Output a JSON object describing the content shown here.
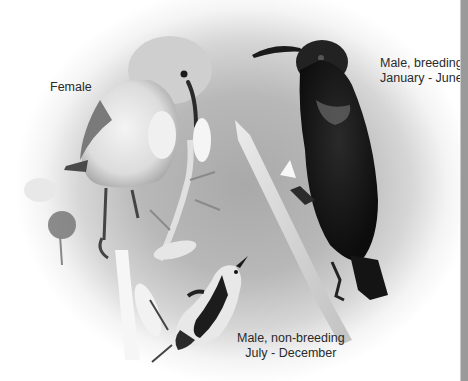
{
  "image": {
    "description": "Three sunbird plumage photos composited on a grey vignette background",
    "background_color": "#b0b0b0",
    "strip_color": "#9a9a9a"
  },
  "labels": {
    "female": {
      "line1": "Female"
    },
    "male_breeding": {
      "line1": "Male, breeding",
      "line2": "January - June"
    },
    "male_nonbreeding": {
      "line1": "Male, non-breeding",
      "line2": "July - December"
    }
  },
  "birds": [
    {
      "name": "female",
      "plumage": "pale grey-white"
    },
    {
      "name": "male-breeding",
      "plumage": "glossy black"
    },
    {
      "name": "male-non-breeding",
      "plumage": "black and white"
    }
  ]
}
